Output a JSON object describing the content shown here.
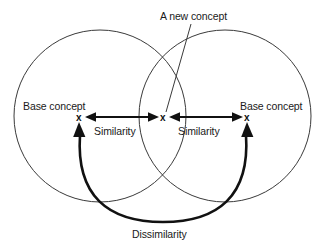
{
  "figure": {
    "type": "venn-diagram",
    "background_color": "#ffffff",
    "stroke_color": "#3a3a3a",
    "emphasis_color": "#111111"
  },
  "labels": {
    "new_concept": "A new concept",
    "base_concept_left": "Base concept",
    "base_concept_right": "Base concept",
    "similarity_left": "Similarity",
    "similarity_right": "Similarity",
    "dissimilarity": "Dissimilarity"
  },
  "markers": {
    "left_x": "x",
    "center_x": "x",
    "right_x": "x"
  },
  "geometry": {
    "left_circle": {
      "cx": 100,
      "cy": 116,
      "r": 86
    },
    "right_circle": {
      "cx": 225,
      "cy": 116,
      "r": 86
    },
    "left_marker": {
      "x": 79,
      "y": 117
    },
    "center_marker": {
      "x": 163,
      "y": 117
    },
    "right_marker": {
      "x": 247,
      "y": 117
    },
    "similarity_arrow_left": {
      "x1": 87,
      "x2": 157,
      "y": 117
    },
    "similarity_arrow_right": {
      "x1": 171,
      "x2": 241,
      "y": 117
    },
    "dissimilarity_arc": {
      "from_x": 79,
      "from_y": 126,
      "to_x": 247,
      "to_y": 126,
      "apex_y": 222
    },
    "leader_line": {
      "x1": 191,
      "y1": 24,
      "x2": 166,
      "y2": 112
    }
  }
}
